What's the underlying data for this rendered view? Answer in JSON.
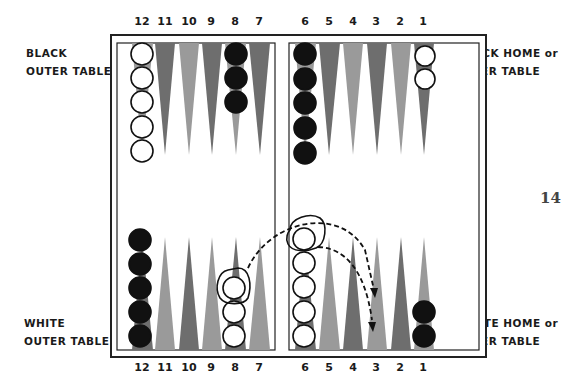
{
  "labels": {
    "top_left": [
      "BLACK",
      "OUTER TABLE"
    ],
    "top_right": [
      "BLACK HOME or",
      "INNER TABLE"
    ],
    "bottom_left": [
      "WHITE",
      "OUTER TABLE"
    ],
    "bottom_right": [
      "WHITE HOME or",
      "INNER TABLE"
    ]
  },
  "page_number": "14",
  "point_numbers_top": [
    "12",
    "11",
    "10",
    "9",
    "8",
    "7",
    "6",
    "5",
    "4",
    "3",
    "2",
    "1"
  ],
  "point_numbers_bottom": [
    "12",
    "11",
    "10",
    "9",
    "8",
    "7",
    "6",
    "5",
    "4",
    "3",
    "2",
    "1"
  ],
  "checkers": {
    "top": {
      "12": {
        "color": "white",
        "count": 5
      },
      "8": {
        "color": "black",
        "count": 3
      },
      "6": {
        "color": "black",
        "count": 5
      },
      "1": {
        "color": "white",
        "count": 2
      }
    },
    "bottom": {
      "12": {
        "color": "black",
        "count": 5
      },
      "8": {
        "color": "white",
        "count": 3
      },
      "6": {
        "color": "white",
        "count": 5
      },
      "1": {
        "color": "black",
        "count": 2
      }
    }
  },
  "annotations": [
    "Circled white checker on bottom point 8 moves to bottom point 3",
    "Circled white checker on bottom point 6 moves to bottom point 3"
  ],
  "colors": {
    "dark_point": "#6e6e6e",
    "light_point": "#9a9a9a",
    "black_checker": "#111111",
    "border": "#222222"
  }
}
